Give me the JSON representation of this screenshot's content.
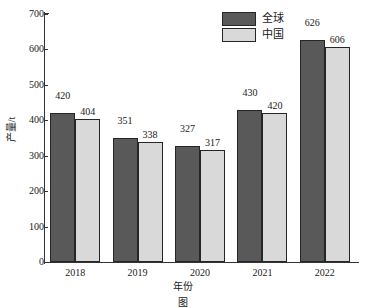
{
  "chart_data": {
    "type": "bar",
    "title": "",
    "xlabel": "年份",
    "ylabel": "产量/t",
    "categories": [
      "2018",
      "2019",
      "2020",
      "2021",
      "2022"
    ],
    "series": [
      {
        "name": "全球",
        "color": "#595959",
        "values": [
          420,
          351,
          327,
          430,
          626
        ]
      },
      {
        "name": "中国",
        "color": "#d9d9d9",
        "values": [
          404,
          338,
          317,
          420,
          606
        ]
      }
    ],
    "ylim": [
      0,
      700
    ],
    "yticks": [
      0,
      100,
      200,
      300,
      400,
      500,
      600,
      700
    ],
    "ytick_labels": [
      "0",
      "100",
      "200",
      "300",
      "400",
      "500",
      "600",
      "700"
    ],
    "grid": false,
    "legend_position": "top-right",
    "bar_edge_color": "#262626",
    "axis_color": "#333333",
    "data_labels": true
  },
  "legend": {
    "items": [
      {
        "label": "全球",
        "color": "#595959"
      },
      {
        "label": "中国",
        "color": "#d9d9d9"
      }
    ]
  },
  "axes": {
    "x_title": "年份",
    "y_title": "产量/t"
  },
  "caption": {
    "text": "图"
  }
}
